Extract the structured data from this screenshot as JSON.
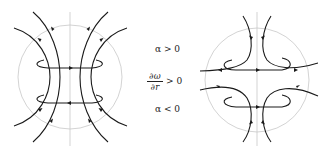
{
  "labels": {
    "alpha_pos": "α > 0",
    "domega_num": "∂ω",
    "domega_den": "∂r",
    "domega_rel": "> 0",
    "alpha_neg": "α < 0"
  },
  "colors": {
    "field_line": "#1a1a1a",
    "guide_circle": "#c8c8c8",
    "axis": "#c8c8c8",
    "text": "#222222"
  },
  "diagrams": [
    {
      "name": "converging-field-left",
      "condition": "α > 0",
      "center": [
        70,
        77
      ],
      "radius": 52
    },
    {
      "name": "diverging-field-right",
      "condition": "α < 0",
      "center": [
        257,
        80
      ],
      "radius": 52
    }
  ]
}
